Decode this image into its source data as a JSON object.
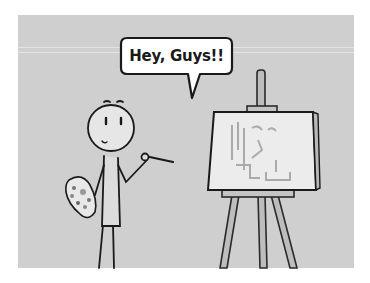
{
  "scene": {
    "description": "Cartoon stick figure painter holding a palette and brush next to an easel with a canvas",
    "speech_bubble": {
      "text": "Hey, Guys!!"
    },
    "colors": {
      "page_background": "#ffffff",
      "panel_background": "#cfcfcf",
      "ink": "#1a1a1a",
      "canvas_fill": "#ececec",
      "bubble_fill": "#ffffff"
    }
  }
}
